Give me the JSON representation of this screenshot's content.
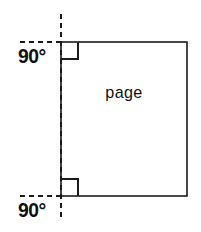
{
  "figure": {
    "canvas": {
      "width": 201,
      "height": 232,
      "background": "#ffffff"
    },
    "stroke_color": "#1a1a1a",
    "text_color": "#111111"
  },
  "labels": {
    "angle_top": "90°",
    "angle_bottom": "90°",
    "face": "page"
  },
  "geometry": {
    "page_rect": {
      "x": 61,
      "y": 42,
      "width": 126,
      "height": 154
    },
    "reference_line": {
      "x": 61,
      "y1": 14,
      "y2": 220,
      "style": "dashed"
    },
    "extension_top": {
      "x1": 20,
      "x2": 61,
      "y": 42,
      "style": "dashed"
    },
    "extension_bottom": {
      "x1": 20,
      "x2": 61,
      "y": 196,
      "style": "dashed"
    },
    "angle_marker_top": {
      "x": 61,
      "y": 42,
      "size": 17
    },
    "angle_marker_bottom": {
      "x": 61,
      "y": 179,
      "size": 17
    }
  }
}
